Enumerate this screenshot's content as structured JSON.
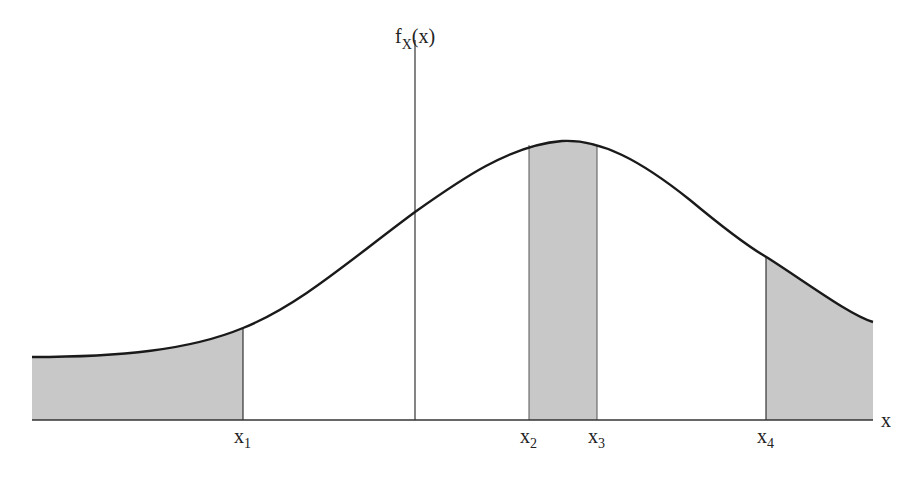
{
  "diagram": {
    "type": "probability-density-curve",
    "y_axis_label": {
      "main": "f",
      "subscript": "X",
      "suffix": "(x)"
    },
    "x_axis_label": "x",
    "ticks": [
      {
        "main": "x",
        "sub": "1"
      },
      {
        "main": "x",
        "sub": "2"
      },
      {
        "main": "x",
        "sub": "3"
      },
      {
        "main": "x",
        "sub": "4"
      }
    ],
    "shaded_regions": [
      {
        "from": "left edge",
        "to": "x1"
      },
      {
        "from": "x2",
        "to": "x3"
      },
      {
        "from": "x4",
        "to": "right edge"
      }
    ],
    "colors": {
      "curve": "#1a1a1a",
      "shade": "#c8c8c8",
      "axis": "#333333"
    }
  }
}
